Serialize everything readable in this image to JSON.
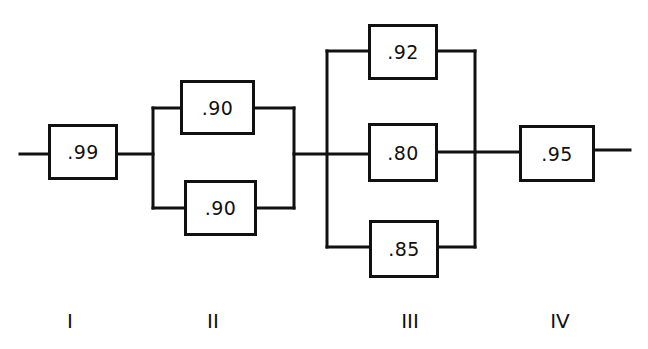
{
  "diagram": {
    "type": "reliability-block-diagram",
    "stages": [
      {
        "label": "I",
        "configuration": "series",
        "components": [
          {
            "reliability": ".99"
          }
        ]
      },
      {
        "label": "II",
        "configuration": "parallel",
        "components": [
          {
            "reliability": ".90"
          },
          {
            "reliability": ".90"
          }
        ]
      },
      {
        "label": "III",
        "configuration": "parallel",
        "components": [
          {
            "reliability": ".92"
          },
          {
            "reliability": ".80"
          },
          {
            "reliability": ".85"
          }
        ]
      },
      {
        "label": "IV",
        "configuration": "series",
        "components": [
          {
            "reliability": ".95"
          }
        ]
      }
    ],
    "line_color": "#111111"
  }
}
